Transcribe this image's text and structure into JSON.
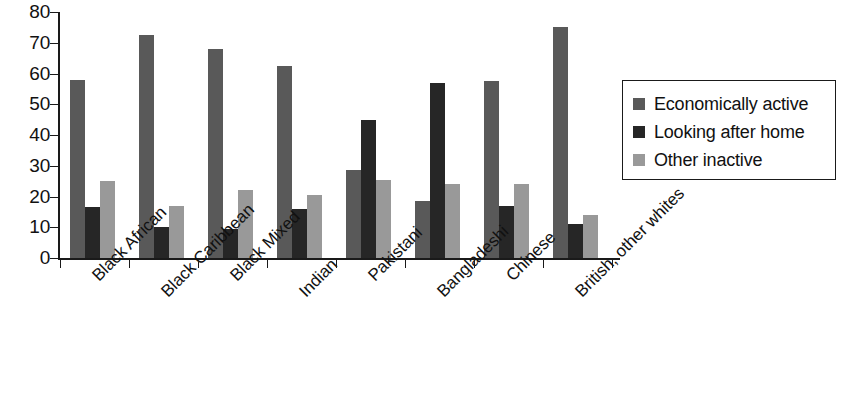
{
  "chart_data": {
    "type": "bar",
    "title": "",
    "subtitle": "",
    "xlabel": "",
    "ylabel": "",
    "ylim": [
      0,
      80
    ],
    "ytick_step": 10,
    "yticks": [
      0,
      10,
      20,
      30,
      40,
      50,
      60,
      70,
      80
    ],
    "grid": false,
    "legend_position": "right",
    "orientation": "vertical",
    "categories": [
      "Black African",
      "Black Caribbean",
      "Black Mixed",
      "Indian",
      "Pakistani",
      "Bangladeshi",
      "Chinese",
      "British, other whites"
    ],
    "series": [
      {
        "name": "Economically active",
        "color": "#595959",
        "values": [
          58,
          72.5,
          68,
          62.5,
          28.5,
          18.5,
          57.5,
          75
        ]
      },
      {
        "name": "Looking after home",
        "color": "#262626",
        "values": [
          16.5,
          10,
          9.5,
          16,
          45,
          57,
          17,
          11
        ]
      },
      {
        "name": "Other inactive",
        "color": "#999999",
        "values": [
          25,
          17,
          22,
          20.5,
          25.5,
          24,
          24,
          14
        ]
      }
    ]
  },
  "legend": {
    "items": [
      {
        "label": "Economically active",
        "color": "#595959"
      },
      {
        "label": "Looking after home",
        "color": "#262626"
      },
      {
        "label": "Other inactive",
        "color": "#999999"
      }
    ]
  },
  "axis": {
    "y_tick_labels": [
      "80",
      "70",
      "60",
      "50",
      "40",
      "30",
      "20",
      "10",
      "0"
    ]
  }
}
